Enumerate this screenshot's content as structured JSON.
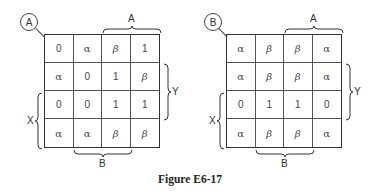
{
  "maps": [
    {
      "id": "A",
      "badge": "A",
      "top_label": "A",
      "right_label": "Y",
      "left_label": "X",
      "bottom_label": "B",
      "cells": [
        [
          "0",
          "α",
          "β",
          "1"
        ],
        [
          "α",
          "0",
          "1",
          "β"
        ],
        [
          "0",
          "0",
          "1",
          "1"
        ],
        [
          "α",
          "α",
          "β",
          "β"
        ]
      ]
    },
    {
      "id": "B",
      "badge": "B",
      "top_label": "A",
      "right_label": "Y",
      "left_label": "X",
      "bottom_label": "B",
      "cells": [
        [
          "α",
          "β",
          "β",
          "α"
        ],
        [
          "α",
          "β",
          "β",
          "α"
        ],
        [
          "0",
          "1",
          "1",
          "0"
        ],
        [
          "α",
          "β",
          "β",
          "α"
        ]
      ]
    }
  ],
  "caption": "Figure E6-17"
}
